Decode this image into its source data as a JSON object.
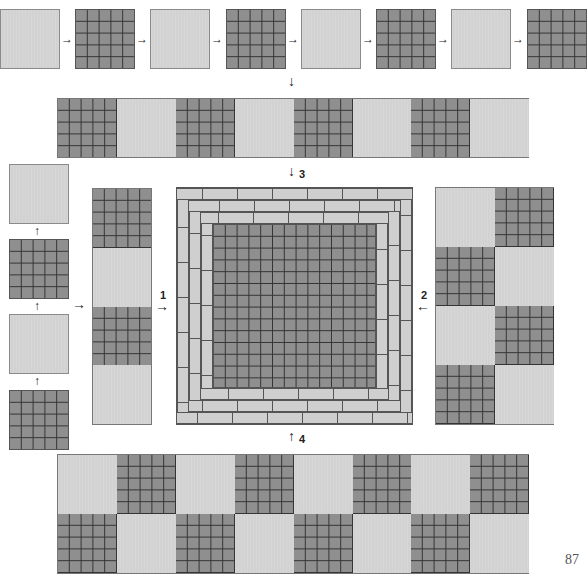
{
  "diagram": {
    "colors": {
      "light_tile": "#d2d2d2",
      "dark_tile": "#8f8f8f",
      "grid_line": "#333333",
      "brick": "#cfcfcf"
    },
    "top_row": {
      "tiles": [
        "light",
        "dark",
        "light",
        "dark",
        "light",
        "dark",
        "light",
        "dark"
      ],
      "arrow_icon": "arrow-right-icon"
    },
    "second_row": {
      "tiles": [
        "dark",
        "light",
        "dark",
        "light",
        "dark",
        "light",
        "dark",
        "light"
      ]
    },
    "left_column": {
      "tiles_top_to_bottom": [
        "light",
        "dark",
        "light",
        "dark"
      ],
      "arrow_icon": "arrow-up-icon"
    },
    "left_strip": {
      "tiles_top_to_bottom": [
        "dark",
        "light",
        "dark",
        "light"
      ]
    },
    "center_panel": {
      "border_rings": 3,
      "interior_grid": "14x14",
      "description": "Dark grid center with three rings of light brick border"
    },
    "right_block": {
      "rows": [
        [
          "light",
          "dark"
        ],
        [
          "dark",
          "light"
        ],
        [
          "light",
          "dark"
        ],
        [
          "dark",
          "light"
        ]
      ]
    },
    "bottom_block": {
      "rows": [
        [
          "light",
          "dark",
          "light",
          "dark",
          "light",
          "dark",
          "light",
          "dark"
        ],
        [
          "dark",
          "light",
          "dark",
          "light",
          "dark",
          "light",
          "dark",
          "light"
        ]
      ]
    },
    "step_labels": {
      "step1": "1",
      "step2": "2",
      "step3": "3",
      "step4": "4"
    },
    "arrows": {
      "right": "→",
      "left": "←",
      "down": "↓",
      "up": "↑"
    },
    "page_number": "87"
  }
}
